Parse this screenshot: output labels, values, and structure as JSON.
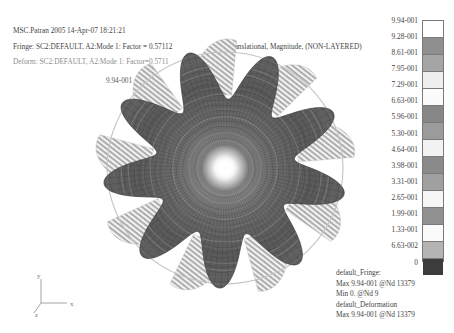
{
  "app": {
    "title_line": "MSC.Patran 2005 14-Apr-07 18:21:21",
    "fringe_line": "Fringe: SC2:DEFAULT, A2:Mode 1: Factor = 0.57112",
    "deform_line": "Deform: SC2:DEFAULT, A2:Mode 1: Factor=0.5711",
    "result_subtitle": "Translational, Magnitude, (NON-LAYERED)",
    "peak_label": "9.94-001"
  },
  "legend": {
    "ticks": [
      "9.94-001",
      "9.28-001",
      "8.61-001",
      "7.95-001",
      "7.29-001",
      "6.63-001",
      "5.96-001",
      "5.30-001",
      "4.64-001",
      "3.98-001",
      "3.31-001",
      "2.65-001",
      "1.99-001",
      "1.33-001",
      "6.63-002",
      "0"
    ],
    "band_colors": [
      "#ffffff",
      "#8f8f8f",
      "#a5a5a5",
      "#eeeeee",
      "#fbfbfb",
      "#878787",
      "#9b9b9b",
      "#f2f2f2",
      "#8a8a8a",
      "#a0a0a0",
      "#f6f6f6",
      "#919191",
      "#fafafa",
      "#b4b4b4",
      "#3c3c3c"
    ],
    "border_color": "#7a7a7a"
  },
  "annotation": {
    "line1": "default_Fringe:",
    "line2": "Max 9.94-001 @Nd 13379",
    "line3": "Min 0. @Nd 9",
    "line4": "default_Deformation",
    "line5": "Max 9.94-001 @Nd 13379"
  },
  "triad": {
    "x_label": "x",
    "y_label": "y",
    "z_label": "z",
    "stroke": "#9a9a9a"
  },
  "chart_data": {
    "type": "heatmap",
    "title": "MSC.Patran 2005 14-Apr-07 18:21:21",
    "subtitle": "Translational, Magnitude, (NON-LAYERED)",
    "colorbar_label": "Translational Magnitude",
    "colorbar_min": 0,
    "colorbar_max": 0.994,
    "colorbar_levels": [
      0.0,
      0.0663,
      0.133,
      0.199,
      0.265,
      0.331,
      0.398,
      0.464,
      0.53,
      0.596,
      0.663,
      0.729,
      0.795,
      0.861,
      0.928,
      0.994
    ],
    "max_value": 0.994,
    "max_node": "13379",
    "min_value": 0.0,
    "min_node": "9",
    "deformation_factor": 0.5711,
    "fringe_factor": 0.57112,
    "mode": "Mode 1",
    "lobes": 9,
    "geometry": "circular bladed disc mode shape, deformed + undeformed overlay",
    "center_px": [
      225,
      168
    ],
    "outer_radius_px": 122,
    "grid": false,
    "legend_position": "right"
  },
  "model": {
    "lobe_count": 9,
    "mesh_radial_rings": 22,
    "mesh_spokes": 108,
    "hub_radius": 9,
    "fringe_dark": "#4c4c4c",
    "fringe_mid": "#7f7f7f",
    "fringe_light": "#d8d8d8",
    "ghost_color": "#c9c9c9"
  }
}
